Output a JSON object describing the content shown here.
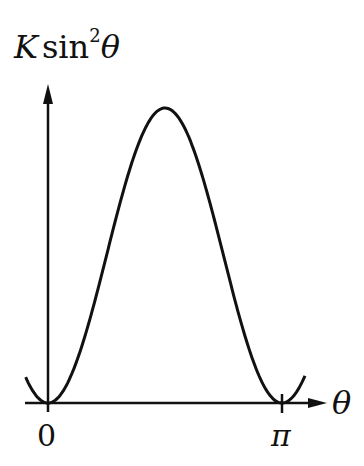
{
  "chart_data": {
    "type": "line",
    "title": "",
    "ylabel": {
      "prefix": "K",
      "func": "sin",
      "power": "2",
      "var": "θ"
    },
    "xlabel": "θ",
    "x_ticks": [
      {
        "value": 0,
        "label": "0"
      },
      {
        "value": 3.14159,
        "label": "π"
      }
    ],
    "series": [
      {
        "name": "K sin²θ",
        "function": "K*sin(theta)^2",
        "x_range": [
          -0.3,
          3.45
        ],
        "peak": {
          "x": 1.5708,
          "y": "K"
        },
        "zeros": [
          0,
          3.14159
        ]
      }
    ],
    "grid": false,
    "legend": null
  },
  "colors": {
    "line": "#111111",
    "background": "#ffffff"
  }
}
